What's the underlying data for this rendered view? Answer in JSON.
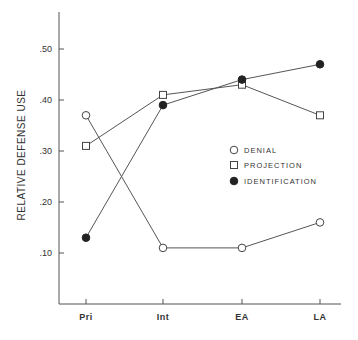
{
  "chart_data": {
    "type": "line",
    "title": "",
    "xlabel": "",
    "ylabel": "RELATIVE DEFENSE USE",
    "categories": [
      "Pri",
      "Int",
      "EA",
      "LA"
    ],
    "yticks": [
      ".10",
      ".20",
      ".30",
      ".40",
      ".50"
    ],
    "ylim": [
      0,
      0.57
    ],
    "grid": false,
    "legend_position": "inside-right-middle",
    "series": [
      {
        "name": "DENIAL",
        "marker": "open-circle",
        "values": [
          0.37,
          0.11,
          0.11,
          0.16
        ]
      },
      {
        "name": "PROJECTION",
        "marker": "open-square",
        "values": [
          0.31,
          0.41,
          0.43,
          0.37
        ]
      },
      {
        "name": "IDENTIFICATION",
        "marker": "filled-circle",
        "values": [
          0.13,
          0.39,
          0.44,
          0.47
        ]
      }
    ]
  },
  "colors": {
    "line": "#555555",
    "marker_fill_filled": "#222222",
    "marker_fill_open": "#ffffff",
    "axis": "#555555"
  }
}
